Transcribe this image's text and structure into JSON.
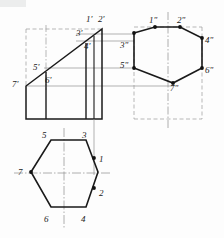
{
  "drawing": {
    "title": "Orthographic projection of truncated hexagonal prism",
    "type": "engineering-drawing",
    "background": "#fdfdfd",
    "ink": "#1a1a1a",
    "thin": "#8a8a8a",
    "dash": "#9a9a9a"
  },
  "views": {
    "front": {
      "name": "front-view",
      "labels": [
        {
          "id": "1p",
          "text": "1'",
          "x": 86,
          "y": 15
        },
        {
          "id": "2p",
          "text": "2'",
          "x": 98,
          "y": 15
        },
        {
          "id": "3p",
          "text": "3'",
          "x": 76,
          "y": 29
        },
        {
          "id": "4p",
          "text": "4'",
          "x": 84,
          "y": 42
        },
        {
          "id": "5p",
          "text": "5'",
          "x": 33,
          "y": 63
        },
        {
          "id": "6p",
          "text": "6'",
          "x": 45,
          "y": 76
        },
        {
          "id": "7p",
          "text": "7'",
          "x": 12,
          "y": 80
        }
      ]
    },
    "side": {
      "name": "side-view",
      "labels": [
        {
          "id": "1pp",
          "text": "1\"",
          "x": 149,
          "y": 16
        },
        {
          "id": "2pp",
          "text": "2\"",
          "x": 177,
          "y": 16
        },
        {
          "id": "3pp",
          "text": "3\"",
          "x": 121,
          "y": 41
        },
        {
          "id": "4pp",
          "text": "4\"",
          "x": 205,
          "y": 36
        },
        {
          "id": "5pp",
          "text": "5\"",
          "x": 121,
          "y": 61
        },
        {
          "id": "6pp",
          "text": "6\"",
          "x": 205,
          "y": 66
        },
        {
          "id": "7pp",
          "text": "7\"",
          "x": 170,
          "y": 84
        }
      ]
    },
    "top": {
      "name": "top-view",
      "labels": [
        {
          "id": "5",
          "text": "5",
          "x": 42,
          "y": 133
        },
        {
          "id": "3",
          "text": "3",
          "x": 82,
          "y": 133
        },
        {
          "id": "1",
          "text": "1",
          "x": 98,
          "y": 157
        },
        {
          "id": "7",
          "text": "7",
          "x": 18,
          "y": 171
        },
        {
          "id": "2",
          "text": "2",
          "x": 98,
          "y": 192
        },
        {
          "id": "6",
          "text": "6",
          "x": 44,
          "y": 218
        },
        {
          "id": "4",
          "text": "4",
          "x": 81,
          "y": 218
        }
      ]
    }
  },
  "geometry": {
    "front_outline": "M 26,86 L 26,119 L 102,119 L 102,29 L 26,86 Z",
    "front_rect_top": "M 26,29 L 102,29",
    "side_hexagon": "M 134,33 L 155,27 L 180,27 L 202,38 L 202,68 L 173,83 L 134,68 Z",
    "top_hexagon": "M 31,172 L 51,140 L 86,140 L 98,172 L 86,207 L 51,207 Z"
  }
}
